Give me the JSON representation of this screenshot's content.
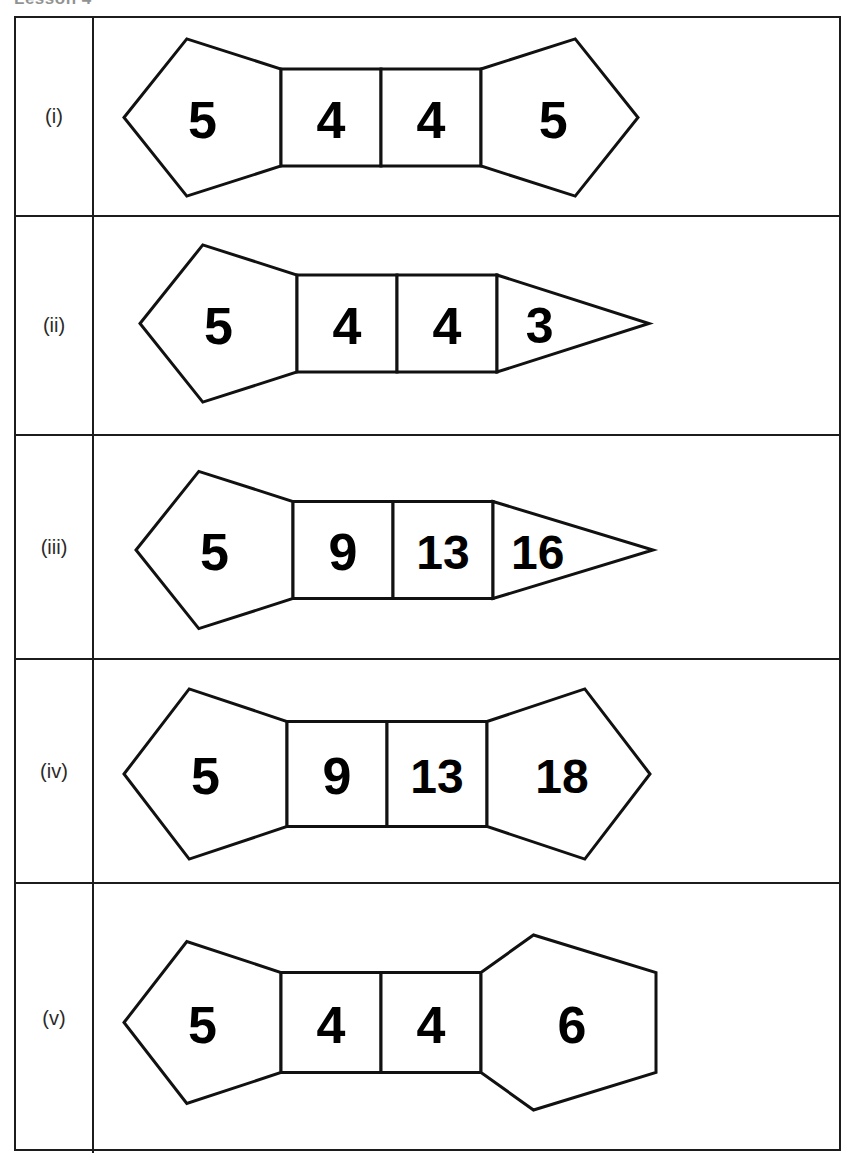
{
  "heading": {
    "text": "Lesson 4"
  },
  "table": {
    "rows": [
      {
        "label": "(i)",
        "figure": {
          "name": "shape-chain-i",
          "shapes": [
            {
              "type": "pentagon-left",
              "value": "5"
            },
            {
              "type": "square",
              "value": "4"
            },
            {
              "type": "square",
              "value": "4"
            },
            {
              "type": "pentagon-right",
              "value": "5"
            }
          ]
        }
      },
      {
        "label": "(ii)",
        "figure": {
          "name": "shape-chain-ii",
          "shapes": [
            {
              "type": "pentagon-left",
              "value": "5"
            },
            {
              "type": "square",
              "value": "4"
            },
            {
              "type": "square",
              "value": "4"
            },
            {
              "type": "triangle-right",
              "value": "3"
            }
          ]
        }
      },
      {
        "label": "(iii)",
        "figure": {
          "name": "shape-chain-iii",
          "shapes": [
            {
              "type": "pentagon-left",
              "value": "5"
            },
            {
              "type": "square",
              "value": "9"
            },
            {
              "type": "square",
              "value": "13"
            },
            {
              "type": "triangle-right",
              "value": "16"
            }
          ]
        }
      },
      {
        "label": "(iv)",
        "figure": {
          "name": "shape-chain-iv",
          "shapes": [
            {
              "type": "pentagon-left",
              "value": "5"
            },
            {
              "type": "square",
              "value": "9"
            },
            {
              "type": "square",
              "value": "13"
            },
            {
              "type": "pentagon-right",
              "value": "18"
            }
          ]
        }
      },
      {
        "label": "(v)",
        "figure": {
          "name": "shape-chain-v",
          "shapes": [
            {
              "type": "pentagon-left",
              "value": "5"
            },
            {
              "type": "square",
              "value": "4"
            },
            {
              "type": "square",
              "value": "4"
            },
            {
              "type": "hexagon-right",
              "value": "6"
            }
          ]
        }
      }
    ]
  },
  "style": {
    "stroke_color": "#111111",
    "fill_color": "#ffffff",
    "border_color": "#1c1c1c",
    "label_color": "#2a2a2a"
  },
  "layout": {
    "row_tops": [
      0,
      199,
      418,
      642,
      866
    ],
    "row_heights": [
      199,
      219,
      224,
      224,
      269
    ]
  }
}
